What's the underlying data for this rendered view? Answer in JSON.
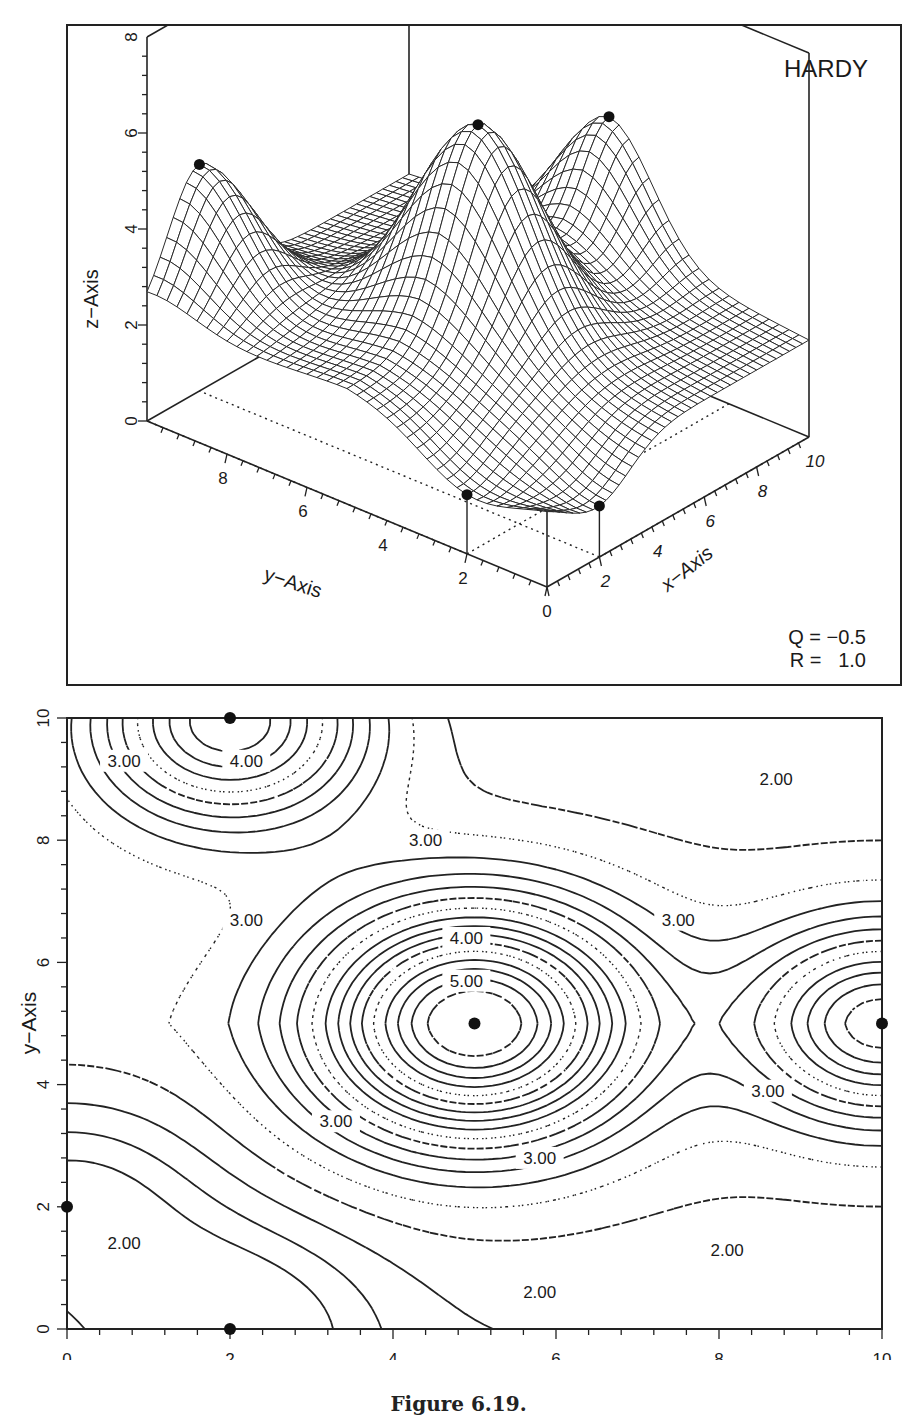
{
  "figure_caption": "Figure 6.19.",
  "chart_data": [
    {
      "type": "surface3d",
      "title": "HARDY",
      "method": "Hardy multiquadric interpolation",
      "parameters": {
        "Q": "-0.5",
        "R": "1.0"
      },
      "parameter_labels": [
        "Q = -0.5",
        "R =  1.0"
      ],
      "xlabel": "x-Axis",
      "ylabel": "y-Axis",
      "zlabel": "z-Axis",
      "xlim": [
        0,
        10
      ],
      "ylim": [
        0,
        10
      ],
      "zlim": [
        0,
        8
      ],
      "x_ticks": [
        "0",
        "2",
        "4",
        "6",
        "8",
        "10"
      ],
      "y_ticks": [
        "2",
        "4",
        "6",
        "8"
      ],
      "z_ticks": [
        "0",
        "2",
        "4",
        "6",
        "8"
      ],
      "grid": false,
      "data_points": [
        {
          "x": 0,
          "y": 2,
          "z": 0
        },
        {
          "x": 2,
          "y": 0,
          "z": 0
        },
        {
          "x": 2,
          "y": 10,
          "z": 5
        },
        {
          "x": 5,
          "y": 5,
          "z": 6
        },
        {
          "x": 10,
          "y": 5,
          "z": 5
        }
      ]
    },
    {
      "type": "contour",
      "xlabel": "x-Axis",
      "ylabel": "y-Axis",
      "xlim": [
        0,
        10
      ],
      "ylim": [
        0,
        10
      ],
      "x_ticks": [
        "0",
        "2",
        "4",
        "6",
        "8",
        "10"
      ],
      "y_ticks": [
        "0",
        "2",
        "4",
        "6",
        "8",
        "10"
      ],
      "contour_labels": [
        {
          "text": "2.00",
          "x": 8.7,
          "y": 9.0
        },
        {
          "text": "3.00",
          "x": 0.7,
          "y": 9.3
        },
        {
          "text": "4.00",
          "x": 2.2,
          "y": 9.3
        },
        {
          "text": "3.00",
          "x": 4.4,
          "y": 8.0
        },
        {
          "text": "3.00",
          "x": 2.2,
          "y": 6.7
        },
        {
          "text": "3.00",
          "x": 7.5,
          "y": 6.7
        },
        {
          "text": "4.00",
          "x": 4.9,
          "y": 6.4
        },
        {
          "text": "5.00",
          "x": 4.9,
          "y": 5.7
        },
        {
          "text": "3.00",
          "x": 8.6,
          "y": 3.9
        },
        {
          "text": "3.00",
          "x": 3.3,
          "y": 3.4
        },
        {
          "text": "3.00",
          "x": 5.8,
          "y": 2.8
        },
        {
          "text": "2.00",
          "x": 0.7,
          "y": 1.4
        },
        {
          "text": "2.00",
          "x": 8.1,
          "y": 1.3
        },
        {
          "text": "2.00",
          "x": 5.8,
          "y": 0.6
        }
      ],
      "contour_levels_range": [
        1.5,
        6.0
      ],
      "contour_interval": 0.25,
      "data_points": [
        {
          "x": 0,
          "y": 2
        },
        {
          "x": 2,
          "y": 0
        },
        {
          "x": 2,
          "y": 10
        },
        {
          "x": 5,
          "y": 5
        },
        {
          "x": 10,
          "y": 5
        }
      ]
    }
  ],
  "plot3d": {
    "title": "HARDY",
    "q_label": "Q = −0.5",
    "r_label": "R =   1.0",
    "z_axis_label": "z−Axis",
    "y_axis_label": "y−Axis",
    "x_axis_label": "x−Axis"
  },
  "contour": {
    "x_axis_label": "x−Axis",
    "y_axis_label": "y−Axis"
  }
}
